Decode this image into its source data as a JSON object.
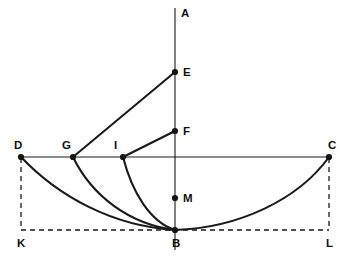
{
  "figure": {
    "background_color": "#ffffff",
    "stroke_color": "#1a1a1a",
    "canvas": {
      "width": 344,
      "height": 264
    }
  },
  "points": [
    {
      "id": "A",
      "label": "A",
      "x": 175,
      "y": 8,
      "label_x": 181,
      "label_y": 17,
      "dot": false
    },
    {
      "id": "E",
      "label": "E",
      "x": 175,
      "y": 72,
      "label_x": 183,
      "label_y": 76,
      "dot": true
    },
    {
      "id": "F",
      "label": "F",
      "x": 175,
      "y": 131,
      "label_x": 183,
      "label_y": 135,
      "dot": true
    },
    {
      "id": "D",
      "label": "D",
      "x": 21,
      "y": 157,
      "label_x": 14,
      "label_y": 149,
      "dot": true
    },
    {
      "id": "G",
      "label": "G",
      "x": 73,
      "y": 157,
      "label_x": 62,
      "label_y": 149,
      "dot": true
    },
    {
      "id": "I",
      "label": "I",
      "x": 123,
      "y": 157,
      "label_x": 114,
      "label_y": 149,
      "dot": true
    },
    {
      "id": "C",
      "label": "C",
      "x": 329,
      "y": 157,
      "label_x": 328,
      "label_y": 149,
      "dot": true
    },
    {
      "id": "M",
      "label": "M",
      "x": 175,
      "y": 198,
      "label_x": 183,
      "label_y": 202,
      "dot": true
    },
    {
      "id": "B",
      "label": "B",
      "x": 175,
      "y": 230,
      "label_x": 172,
      "label_y": 247,
      "dot": true
    },
    {
      "id": "K",
      "label": "K",
      "x": 21,
      "y": 230,
      "label_x": 17,
      "label_y": 247,
      "dot": false
    },
    {
      "id": "L",
      "label": "L",
      "x": 329,
      "y": 230,
      "label_x": 326,
      "label_y": 247,
      "dot": false
    }
  ],
  "axes": [
    {
      "name": "vertical-axis-AB",
      "from": "A",
      "to": "B",
      "d": "M 175 8 L 175 250"
    },
    {
      "name": "horizontal-axis-DC",
      "from": "D",
      "to": "C",
      "d": "M 21 157 L 329 157"
    }
  ],
  "chords": [
    {
      "name": "chord-GE",
      "from": "G",
      "to": "E",
      "d": "M 73 157 L 175 72"
    },
    {
      "name": "chord-IF",
      "from": "I",
      "to": "F",
      "d": "M 123 157 L 175 131"
    }
  ],
  "curves": [
    {
      "name": "curve-DB",
      "from": "D",
      "to": "B",
      "d": "M 21 157 C 58 196 112 226 175 230"
    },
    {
      "name": "curve-GB",
      "from": "G",
      "to": "B",
      "d": "M 73 157 C 92 196 129 224 175 230"
    },
    {
      "name": "curve-IB",
      "from": "I",
      "to": "B",
      "d": "M 123 157 C 132 192 150 222 175 230"
    },
    {
      "name": "curve-BC",
      "from": "B",
      "to": "C",
      "d": "M 175 230 C 238 228 298 200 329 157"
    }
  ],
  "dashed_lines": [
    {
      "name": "dashed-DK",
      "from": "D",
      "to": "K",
      "d": "M 21 158 L 21 230"
    },
    {
      "name": "dashed-KL",
      "from": "K",
      "to": "L",
      "d": "M 21 230 L 329 230"
    },
    {
      "name": "dashed-CL",
      "from": "C",
      "to": "L",
      "d": "M 329 158 L 329 230"
    }
  ],
  "dot_radius": 3.1
}
